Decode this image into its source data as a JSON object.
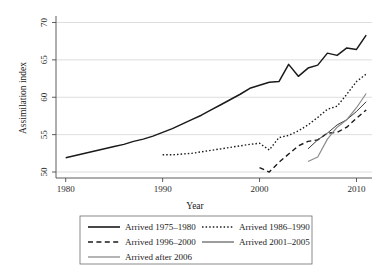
{
  "chart_data": {
    "type": "line",
    "title": "",
    "xlabel": "Year",
    "ylabel": "Assimilation index",
    "xlim": [
      1979,
      2011.6
    ],
    "ylim": [
      49.2,
      70.6
    ],
    "xticks": [
      1980,
      1990,
      2000,
      2010
    ],
    "yticks": [
      50,
      55,
      60,
      65,
      70
    ],
    "grid": "horizontal",
    "legend_position": "below-plot",
    "series": [
      {
        "name": "Arrived 1975–1980",
        "style": "solid",
        "color": "#1a1a1a",
        "width": 1.5,
        "x": [
          1980,
          1981,
          1982,
          1983,
          1984,
          1985,
          1986,
          1987,
          1988,
          1989,
          1990,
          1991,
          1992,
          1993,
          1994,
          1995,
          1996,
          1997,
          1998,
          1999,
          2000,
          2001,
          2002,
          2003,
          2004,
          2005,
          2006,
          2007,
          2008,
          2009,
          2010,
          2011
        ],
        "values": [
          51.9,
          52.2,
          52.5,
          52.8,
          53.1,
          53.4,
          53.7,
          54.1,
          54.4,
          54.8,
          55.3,
          55.8,
          56.4,
          57.0,
          57.6,
          58.3,
          59.0,
          59.7,
          60.4,
          61.2,
          61.6,
          62.0,
          62.1,
          64.4,
          62.8,
          63.9,
          64.3,
          65.9,
          65.6,
          66.6,
          66.4,
          68.3
        ]
      },
      {
        "name": "Arrived 1986–1990",
        "style": "dotted",
        "color": "#1a1a1a",
        "width": 1.4,
        "x": [
          1990,
          1991,
          1992,
          1993,
          1994,
          1995,
          1996,
          1997,
          1998,
          1999,
          2000,
          2001,
          2002,
          2003,
          2004,
          2005,
          2006,
          2007,
          2008,
          2009,
          2010,
          2011
        ],
        "values": [
          52.3,
          52.3,
          52.4,
          52.5,
          52.7,
          52.9,
          53.1,
          53.3,
          53.5,
          53.7,
          53.85,
          52.95,
          54.6,
          54.9,
          55.5,
          56.3,
          57.3,
          58.4,
          58.8,
          60.4,
          62.1,
          63.1
        ]
      },
      {
        "name": "Arrived 1996–2000",
        "style": "dashed",
        "color": "#1a1a1a",
        "width": 1.4,
        "x": [
          2000,
          2001,
          2002,
          2003,
          2004,
          2005,
          2006,
          2007,
          2008,
          2009,
          2010,
          2011
        ],
        "values": [
          50.6,
          50.0,
          51.3,
          52.4,
          53.5,
          54.1,
          54.3,
          55.2,
          55.3,
          56.0,
          57.2,
          58.3
        ]
      },
      {
        "name": "Arrived 2001–2005",
        "style": "solid",
        "color": "#3a3a3a",
        "width": 1.0,
        "x": [
          2005,
          2006,
          2007,
          2008,
          2009,
          2010,
          2011
        ],
        "values": [
          53.1,
          54.3,
          55.2,
          56.3,
          57.0,
          58.1,
          59.4
        ]
      },
      {
        "name": "Arrived after 2006",
        "style": "solid",
        "color": "#8c8c8c",
        "width": 1.2,
        "x": [
          2005,
          2006,
          2007,
          2008,
          2009,
          2010,
          2011
        ],
        "values": [
          51.4,
          52.0,
          54.4,
          56.0,
          57.0,
          58.6,
          60.5
        ]
      }
    ]
  },
  "legend": {
    "entries": [
      {
        "label": "Arrived 1975–1980",
        "style": "solid",
        "color": "#1a1a1a",
        "width": 1.6
      },
      {
        "label": "Arrived 1986–1990",
        "style": "dotted",
        "color": "#1a1a1a",
        "width": 1.4
      },
      {
        "label": "Arrived 1996–2000",
        "style": "dashed",
        "color": "#1a1a1a",
        "width": 1.4
      },
      {
        "label": "Arrived 2001–2005",
        "style": "solid",
        "color": "#3a3a3a",
        "width": 1.0
      },
      {
        "label": "Arrived after 2006",
        "style": "solid",
        "color": "#8c8c8c",
        "width": 1.3
      }
    ]
  },
  "axes": {
    "x_tick_labels": [
      "1980",
      "1990",
      "2000",
      "2010"
    ],
    "y_tick_labels": [
      "50",
      "55",
      "60",
      "65",
      "70"
    ],
    "x_title": "Year",
    "y_title": "Assimilation index"
  }
}
